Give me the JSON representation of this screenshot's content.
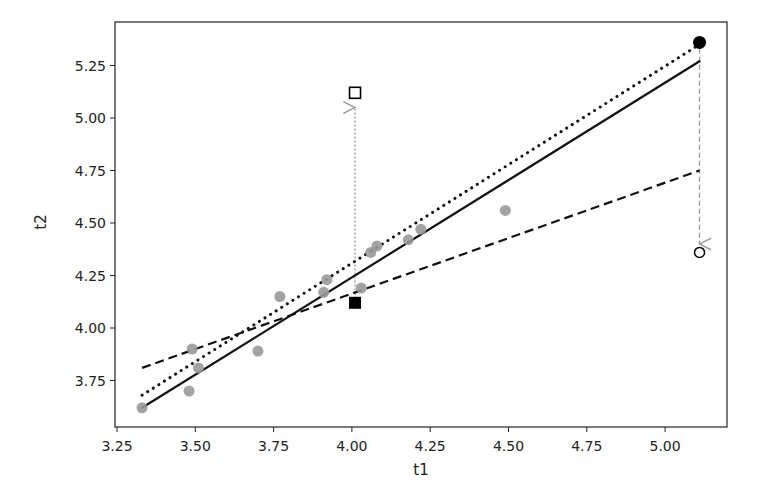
{
  "chart_data": {
    "type": "scatter",
    "title": "",
    "xlabel": "t1",
    "ylabel": "t2",
    "xlim": [
      3.24,
      5.21
    ],
    "ylim": [
      3.56,
      5.44
    ],
    "grid": false,
    "legend": null,
    "xticks": [
      3.25,
      3.5,
      3.75,
      4.0,
      4.25,
      4.5,
      4.75,
      5.0
    ],
    "xtick_labels": [
      "3.25",
      "3.50",
      "3.75",
      "4.00",
      "4.25",
      "4.50",
      "4.75",
      "5.00"
    ],
    "yticks": [
      3.75,
      4.0,
      4.25,
      4.5,
      4.75,
      5.0,
      5.25
    ],
    "ytick_labels": [
      "3.75",
      "4.00",
      "4.25",
      "4.50",
      "4.75",
      "5.00",
      "5.25"
    ],
    "series": [
      {
        "name": "data points",
        "kind": "scatter",
        "marker": "circle-filled",
        "color": "#999999",
        "points": [
          [
            3.33,
            3.62
          ],
          [
            3.48,
            3.7
          ],
          [
            3.49,
            3.9
          ],
          [
            3.51,
            3.81
          ],
          [
            3.7,
            3.89
          ],
          [
            3.77,
            4.15
          ],
          [
            3.91,
            4.17
          ],
          [
            3.92,
            4.23
          ],
          [
            4.03,
            4.19
          ],
          [
            4.06,
            4.36
          ],
          [
            4.08,
            4.39
          ],
          [
            4.18,
            4.42
          ],
          [
            4.22,
            4.47
          ],
          [
            4.49,
            4.56
          ]
        ]
      },
      {
        "name": "fit solid",
        "kind": "line",
        "style": "solid",
        "color": "#111111",
        "points": [
          [
            3.33,
            3.62
          ],
          [
            5.11,
            5.27
          ]
        ]
      },
      {
        "name": "fit dotted",
        "kind": "line",
        "style": "dotted",
        "color": "#111111",
        "points": [
          [
            3.33,
            3.68
          ],
          [
            5.11,
            5.35
          ]
        ]
      },
      {
        "name": "fit dashed",
        "kind": "line",
        "style": "dashed",
        "color": "#111111",
        "points": [
          [
            3.33,
            3.81
          ],
          [
            5.11,
            4.75
          ]
        ]
      }
    ],
    "special_points": [
      {
        "name": "square-filled",
        "marker": "square-filled",
        "color": "#000000",
        "x": 4.01,
        "y": 4.12
      },
      {
        "name": "square-open",
        "marker": "square-open",
        "color": "#000000",
        "x": 4.01,
        "y": 5.12
      },
      {
        "name": "circle-filled-black",
        "marker": "circle-filled",
        "color": "#000000",
        "x": 5.11,
        "y": 5.36
      },
      {
        "name": "circle-open",
        "marker": "circle-open",
        "color": "#000000",
        "x": 5.11,
        "y": 4.36
      }
    ],
    "annotations": [
      {
        "type": "arrow",
        "style": "dotted",
        "color": "#999999",
        "from": [
          4.01,
          4.14
        ],
        "to": [
          5.0,
          5.05
        ],
        "x_fixed": 4.01,
        "y_from": 4.14,
        "y_to": 5.05
      },
      {
        "type": "arrow",
        "style": "dashed",
        "color": "#999999",
        "x_fixed": 5.11,
        "y_from": 5.33,
        "y_to": 4.4
      }
    ]
  },
  "layout": {
    "plot_left": 115,
    "plot_top": 22,
    "plot_right": 727,
    "plot_bottom": 427
  }
}
